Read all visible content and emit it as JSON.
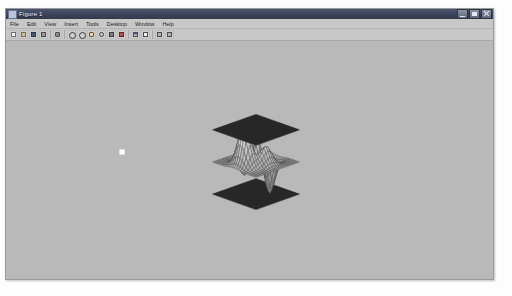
{
  "window": {
    "title": "Figure 1",
    "icon": "figure-icon",
    "buttons": [
      {
        "name": "minimize-button",
        "label": "Minimize"
      },
      {
        "name": "maximize-button",
        "label": "Maximize"
      },
      {
        "name": "close-button",
        "label": "Close"
      }
    ]
  },
  "menubar": {
    "items": [
      {
        "label": "File"
      },
      {
        "label": "Edit"
      },
      {
        "label": "View"
      },
      {
        "label": "Insert"
      },
      {
        "label": "Tools"
      },
      {
        "label": "Desktop"
      },
      {
        "label": "Window"
      },
      {
        "label": "Help"
      }
    ]
  },
  "toolbar": {
    "items": [
      {
        "name": "new-figure-icon",
        "label": "New Figure",
        "glyph": "ic-page"
      },
      {
        "name": "open-file-icon",
        "label": "Open File",
        "glyph": "ic-folder"
      },
      {
        "name": "save-figure-icon",
        "label": "Save Figure",
        "glyph": "ic-save"
      },
      {
        "name": "print-figure-icon",
        "label": "Print Figure",
        "glyph": "ic-print"
      },
      {
        "name": "separator",
        "label": "",
        "glyph": "sep"
      },
      {
        "name": "link-plot-icon",
        "label": "Link Plot",
        "glyph": "ic-link"
      },
      {
        "name": "separator",
        "label": "",
        "glyph": "sep"
      },
      {
        "name": "zoom-in-icon",
        "label": "Zoom In",
        "glyph": "ic-glass"
      },
      {
        "name": "zoom-out-icon",
        "label": "Zoom Out",
        "glyph": "ic-glass"
      },
      {
        "name": "pan-icon",
        "label": "Pan",
        "glyph": "ic-hand"
      },
      {
        "name": "rotate-3d-icon",
        "label": "Rotate 3D",
        "glyph": "ic-rot"
      },
      {
        "name": "data-cursor-icon",
        "label": "Data Cursor",
        "glyph": "ic-cursor"
      },
      {
        "name": "brush-icon",
        "label": "Brush/Select Data",
        "glyph": "ic-brush"
      },
      {
        "name": "separator",
        "label": "",
        "glyph": "sep"
      },
      {
        "name": "insert-colorbar-icon",
        "label": "Insert Colorbar",
        "glyph": "ic-cbar"
      },
      {
        "name": "insert-legend-icon",
        "label": "Insert Legend",
        "glyph": "ic-legend"
      },
      {
        "name": "separator",
        "label": "",
        "glyph": "sep"
      },
      {
        "name": "hide-plot-tools-icon",
        "label": "Hide Plot Tools",
        "glyph": "ic-tools"
      },
      {
        "name": "show-plot-tools-icon",
        "label": "Show Plot Tools",
        "glyph": "ic-tools"
      }
    ]
  },
  "figure": {
    "background_color": "#b9b9b9",
    "axes_visible": false,
    "cursor_marker": {
      "x": 113,
      "y": 108,
      "color": "#ffffff"
    }
  },
  "chart_data": {
    "type": "surface",
    "title": "",
    "xlabel": "",
    "ylabel": "",
    "zlabel": "",
    "grid": false,
    "legend": null,
    "projection": "3d-orthographic",
    "view": {
      "azimuth": -37.5,
      "elevation": 30
    },
    "xlim": [
      -3,
      3
    ],
    "ylim": [
      -3,
      3
    ],
    "zlim": [
      -8,
      8
    ],
    "mesh_divisions": {
      "x": 24,
      "y": 24
    },
    "series": [
      {
        "name": "upper-plane",
        "type": "mesh-plane",
        "z": 6,
        "face_color": "#3a3a3a",
        "edge_color": "#1a1a1a",
        "description": "flat dark mesh plane above the surface"
      },
      {
        "name": "peaks-surface",
        "type": "wireframe-surface",
        "function": "peaks",
        "z_min": -6.5,
        "z_max": 8.1,
        "face_color": "#cfcfcf",
        "edge_color": "#4a4a4a",
        "description": "central light wireframe saddle/peaks surface"
      },
      {
        "name": "lower-plane",
        "type": "mesh-plane",
        "z": -6,
        "face_color": "#3a3a3a",
        "edge_color": "#1a1a1a",
        "description": "flat dark mesh plane below the surface"
      }
    ]
  }
}
